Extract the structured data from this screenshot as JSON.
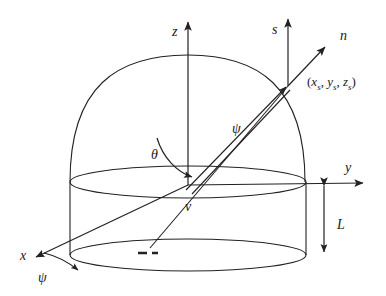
{
  "figure": {
    "background_color": "#ffffff",
    "line_color": "#222222"
  },
  "axes": [
    {
      "id": "z",
      "label": "z",
      "description": "vertical axis through origin pointing up"
    },
    {
      "id": "y",
      "label": "y",
      "description": "horizontal axis pointing right"
    },
    {
      "id": "x",
      "label": "x",
      "description": "axis pointing toward lower-left (out of page)"
    }
  ],
  "vectors": [
    {
      "id": "s",
      "label": "s",
      "description": "vertical unit vector at surface point"
    },
    {
      "id": "n",
      "label": "n",
      "description": "surface normal vector at surface point"
    },
    {
      "id": "v",
      "label": "v",
      "description": "ray vector crossing the cylinder"
    }
  ],
  "angles": [
    {
      "id": "theta",
      "label": "θ",
      "description": "polar angle measured from z axis"
    },
    {
      "id": "psi_upper",
      "label": "ψ",
      "description": "angle label along the ray near the surface point"
    },
    {
      "id": "psi_lower",
      "label": "ψ",
      "description": "azimuth angle at the x axis in the base plane"
    }
  ],
  "points": [
    {
      "id": "surface_point",
      "label_parts": {
        "open": "(",
        "x": "x",
        "x_sub": "s",
        "sep1": ", ",
        "y": "y",
        "y_sub": "s",
        "sep2": ", ",
        "z": "z",
        "z_sub": "s",
        "close": ")"
      },
      "label_text": "(xs, ys, zs)",
      "description": "point on the dome surface where s and n originate"
    }
  ],
  "dimensions": [
    {
      "id": "L",
      "label": "L",
      "description": "height of the cylindrical section, double headed arrow"
    }
  ],
  "shapes": [
    {
      "id": "dome",
      "description": "hemispherical dome cap"
    },
    {
      "id": "top-ellipse",
      "description": "top rim of cylinder"
    },
    {
      "id": "bottom-ellipse",
      "description": "bottom rim of cylinder"
    },
    {
      "id": "cylinder-walls",
      "description": "left and right vertical wall lines"
    },
    {
      "id": "dashed-segment",
      "description": "short dashed marker inside the base ellipse"
    }
  ]
}
